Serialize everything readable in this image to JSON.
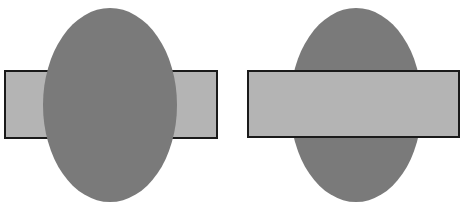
{
  "figure": {
    "colors": {
      "background": "#ffffff",
      "ellipse_fill": "#7a7a7a",
      "rectangle_fill": "#b4b4b4",
      "rectangle_stroke": "#1a1a1a"
    },
    "panels": [
      {
        "name": "ellipse-in-front",
        "front_shape": "ellipse",
        "back_shape": "rectangle"
      },
      {
        "name": "rectangle-in-front",
        "front_shape": "rectangle",
        "back_shape": "ellipse"
      }
    ]
  }
}
